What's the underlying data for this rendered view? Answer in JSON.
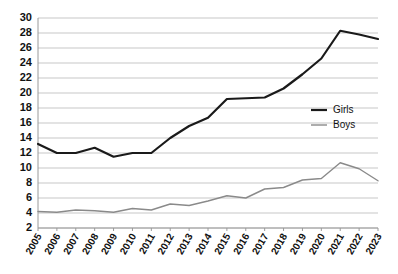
{
  "chart_data": {
    "type": "line",
    "title": "",
    "subtitle": "",
    "xlabel": "",
    "ylabel": "",
    "categories": [
      "2005",
      "2006",
      "2007",
      "2008",
      "2009",
      "2010",
      "2011",
      "2012",
      "2013",
      "2014",
      "2015",
      "2016",
      "2017",
      "2018",
      "2019",
      "2020",
      "2021",
      "2022",
      "2023"
    ],
    "ylim": [
      2,
      30
    ],
    "ytick_step": 2,
    "yticks": [
      2,
      4,
      6,
      8,
      10,
      12,
      14,
      16,
      18,
      20,
      22,
      24,
      26,
      28,
      30
    ],
    "grid": true,
    "legend_position": "center-right",
    "series": [
      {
        "name": "Girls",
        "color": "#1a1a1a",
        "width": 2.2,
        "values": [
          13.2,
          12.0,
          12.0,
          12.7,
          11.5,
          12.0,
          12.0,
          14.0,
          15.6,
          16.7,
          19.2,
          19.3,
          19.4,
          20.6,
          22.5,
          24.6,
          28.3,
          27.8,
          27.2
        ]
      },
      {
        "name": "Boys",
        "color": "#8a8a8a",
        "width": 1.4,
        "values": [
          4.2,
          4.1,
          4.4,
          4.3,
          4.1,
          4.6,
          4.4,
          5.2,
          5.0,
          5.6,
          6.3,
          6.0,
          7.2,
          7.4,
          8.4,
          8.6,
          10.7,
          9.9,
          8.3
        ]
      }
    ]
  },
  "legend": {
    "entries": [
      {
        "label": "Girls"
      },
      {
        "label": "Boys"
      }
    ]
  },
  "axes": {
    "y": {
      "labels": [
        "30",
        "28",
        "26",
        "24",
        "22",
        "20",
        "18",
        "16",
        "14",
        "12",
        "10",
        "8",
        "6",
        "4",
        "2"
      ]
    },
    "x": {
      "labels": [
        "2005",
        "2006",
        "2007",
        "2008",
        "2009",
        "2010",
        "2011",
        "2012",
        "2013",
        "2014",
        "2015",
        "2016",
        "2017",
        "2018",
        "2019",
        "2020",
        "2021",
        "2022",
        "2023"
      ]
    }
  }
}
